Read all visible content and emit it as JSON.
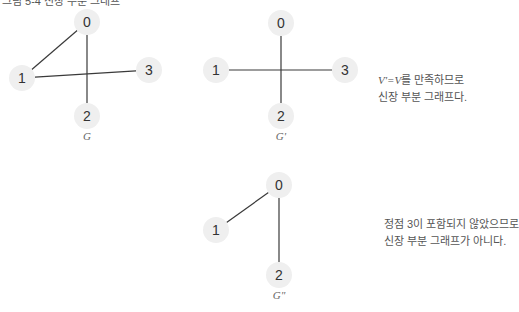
{
  "header": {
    "caption": "그림 5-4 신장 부분 그래프"
  },
  "graphs": [
    {
      "id": "G",
      "label": "G",
      "nodes": [
        {
          "id": "0",
          "x": 87,
          "y": 22
        },
        {
          "id": "1",
          "x": 22,
          "y": 78
        },
        {
          "id": "2",
          "x": 87,
          "y": 116
        },
        {
          "id": "3",
          "x": 149,
          "y": 70
        }
      ],
      "edges": [
        [
          "0",
          "1"
        ],
        [
          "0",
          "2"
        ],
        [
          "1",
          "3"
        ]
      ],
      "label_pos": {
        "x": 87,
        "y": 140
      }
    },
    {
      "id": "G'",
      "label": "G'",
      "nodes": [
        {
          "id": "0",
          "x": 281,
          "y": 23
        },
        {
          "id": "1",
          "x": 216,
          "y": 70
        },
        {
          "id": "2",
          "x": 281,
          "y": 116
        },
        {
          "id": "3",
          "x": 345,
          "y": 70
        }
      ],
      "edges": [
        [
          "0",
          "2"
        ],
        [
          "1",
          "3"
        ]
      ],
      "label_pos": {
        "x": 281,
        "y": 140
      }
    },
    {
      "id": "G''",
      "label": "G\"",
      "nodes": [
        {
          "id": "0",
          "x": 279,
          "y": 185
        },
        {
          "id": "1",
          "x": 216,
          "y": 230
        },
        {
          "id": "2",
          "x": 279,
          "y": 275
        }
      ],
      "edges": [
        [
          "0",
          "1"
        ],
        [
          "0",
          "2"
        ]
      ],
      "label_pos": {
        "x": 279,
        "y": 299
      }
    }
  ],
  "notes": {
    "g_prime": {
      "formula": "V'=V",
      "line1_suffix": "를 만족하므로",
      "line2": "신장 부분 그래프다."
    },
    "g_double_prime": {
      "line1": "정점 3이 포함되지 않았으므로",
      "line2": "신장 부분 그래프가 아니다."
    }
  },
  "colors": {
    "node_fill": "#efefef",
    "edge": "#3a3a3a",
    "text": "#333333",
    "note_text": "#555555"
  }
}
